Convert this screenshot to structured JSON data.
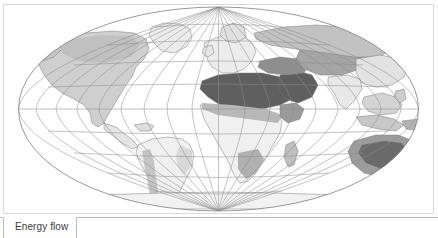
{
  "map": {
    "title": "World Map",
    "projection": "hammer-aitoff",
    "graticule": {
      "meridian_interval_deg": 20,
      "parallel_interval_deg": 20,
      "line_color": "#8a8a8a",
      "outline_color": "#6f6f6f"
    },
    "land": {
      "fill_light": "#f2f2f2",
      "fill_mid": "#c9c9c9",
      "fill_dark": "#8c8c8c",
      "fill_darkest": "#636363",
      "border_color": "#7d7d7d"
    },
    "ocean_fill": "#ffffff",
    "frame_color": "#d9d9d9"
  },
  "legend": {
    "label": "Energy flow",
    "sublabel": "",
    "box_border_color": "#bcbcbc",
    "rule_color": "#bcbcbc"
  },
  "regions": [
    {
      "name": "North America",
      "shade": "mid"
    },
    {
      "name": "Greenland",
      "shade": "light"
    },
    {
      "name": "South America",
      "shade": "light"
    },
    {
      "name": "Europe",
      "shade": "light"
    },
    {
      "name": "Sahara / North Africa",
      "shade": "darkest"
    },
    {
      "name": "Sub-Saharan Africa",
      "shade": "light"
    },
    {
      "name": "Arabian Peninsula",
      "shade": "darkest"
    },
    {
      "name": "Central Asia",
      "shade": "mid"
    },
    {
      "name": "Siberia",
      "shade": "mid"
    },
    {
      "name": "South Asia",
      "shade": "light"
    },
    {
      "name": "East Asia",
      "shade": "light"
    },
    {
      "name": "Southeast Asia",
      "shade": "light"
    },
    {
      "name": "Australia",
      "shade": "dark"
    },
    {
      "name": "Antarctica",
      "shade": "light"
    }
  ]
}
